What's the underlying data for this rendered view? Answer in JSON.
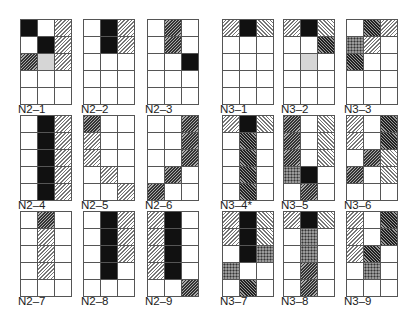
{
  "figure": {
    "legend_note": "Fill codes: B=black, G=gray, L=light forward hatch, D=dark forward hatch, R=light back hatch, K=dark back hatch, X=dotted, .=empty",
    "panels": [
      {
        "id": "N2-1",
        "label": "N2–1",
        "x": 20,
        "y": 19,
        "rows": [
          "B.L",
          ".BL",
          "DGL",
          "...",
          "..."
        ]
      },
      {
        "id": "N2-2",
        "label": "N2–2",
        "x": 83,
        "y": 19,
        "rows": [
          ".BL",
          ".BL",
          "...",
          "...",
          "..."
        ]
      },
      {
        "id": "N2-3",
        "label": "N2–3",
        "x": 147,
        "y": 19,
        "rows": [
          ".D.",
          ".D.",
          "..B",
          "...",
          "..."
        ]
      },
      {
        "id": "N3-1",
        "label": "N3–1",
        "x": 222,
        "y": 19,
        "rows": [
          "LBR",
          "...",
          "...",
          "...",
          "..."
        ]
      },
      {
        "id": "N3-2",
        "label": "N3–2",
        "x": 283,
        "y": 19,
        "rows": [
          "LBR",
          "..K",
          ".G.",
          "...",
          "..."
        ]
      },
      {
        "id": "N3-3",
        "label": "N3–3",
        "x": 346,
        "y": 19,
        "rows": [
          ".KL",
          "XL.",
          "K..",
          "...",
          "..."
        ]
      },
      {
        "id": "N2-4",
        "label": "N2–4",
        "x": 20,
        "y": 115,
        "rows": [
          ".BL",
          ".BL",
          ".BL",
          ".BL",
          ".BL"
        ]
      },
      {
        "id": "N2-5",
        "label": "N2–5",
        "x": 83,
        "y": 115,
        "rows": [
          "D..",
          "L..",
          "L..",
          ".L.",
          "..L"
        ]
      },
      {
        "id": "N2-6",
        "label": "N2–6",
        "x": 147,
        "y": 115,
        "rows": [
          "..D",
          "..D",
          "..D",
          ".D.",
          "D.."
        ]
      },
      {
        "id": "N3-4",
        "label": "N3–4*",
        "x": 222,
        "y": 115,
        "rows": [
          "LBR",
          ".K.",
          ".K.",
          ".K.",
          ".K."
        ]
      },
      {
        "id": "N3-5",
        "label": "N3–5",
        "x": 283,
        "y": 115,
        "rows": [
          "D.R",
          "D.R",
          "D.R",
          "XB.",
          ".D."
        ]
      },
      {
        "id": "N3-6",
        "label": "N3–6",
        "x": 346,
        "y": 115,
        "rows": [
          "L.K",
          "L.K",
          ".DR",
          "D.R",
          "..."
        ]
      },
      {
        "id": "N2-7",
        "label": "N2–7",
        "x": 20,
        "y": 211,
        "rows": [
          ".D.",
          ".L.",
          ".L.",
          ".L.",
          "..."
        ]
      },
      {
        "id": "N2-8",
        "label": "N2–8",
        "x": 83,
        "y": 211,
        "rows": [
          ".BL",
          ".BL",
          ".BL",
          ".B.",
          "..."
        ]
      },
      {
        "id": "N2-9",
        "label": "N2–9",
        "x": 147,
        "y": 211,
        "rows": [
          "LB.",
          "LB.",
          "LB.",
          "LB.",
          "..D"
        ]
      },
      {
        "id": "N3-7",
        "label": "N3–7",
        "x": 222,
        "y": 211,
        "rows": [
          "LBR",
          "LBR",
          ".BX",
          "X..",
          ".K."
        ]
      },
      {
        "id": "N3-8",
        "label": "N3–8",
        "x": 283,
        "y": 211,
        "rows": [
          "LBR",
          ".X.",
          ".X.",
          ".D.",
          ".D."
        ]
      },
      {
        "id": "N3-9",
        "label": "N3–9",
        "x": 346,
        "y": 211,
        "rows": [
          "L.K",
          "L.K",
          "LK.",
          ".X.",
          "..."
        ]
      }
    ]
  }
}
